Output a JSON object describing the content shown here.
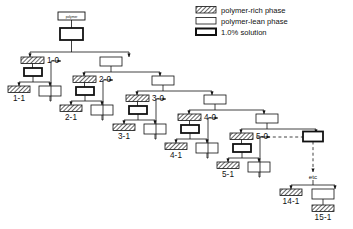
{
  "figure": {
    "background_color": "#ffffff",
    "line_color": "#111111",
    "title": "",
    "type": "cascade-fractionation-tree"
  },
  "legend": {
    "position": "top-right",
    "items": [
      {
        "swatch": "hatched-box",
        "label": "polymer-rich phase"
      },
      {
        "swatch": "plain-box",
        "label": "polymer-lean phase"
      },
      {
        "swatch": "thick-box",
        "label": "1.0% solution"
      }
    ]
  },
  "source": {
    "label": "polymer"
  },
  "stage_labels": [
    "1-0",
    "2-0",
    "3-0",
    "4-0",
    "5-0"
  ],
  "fraction_labels": [
    "1-1",
    "2-1",
    "3-1",
    "4-1",
    "5-1"
  ],
  "continuation": {
    "label": "etc"
  },
  "tail_labels": [
    "14-1",
    "15-1"
  ],
  "box_types": {
    "rich": "polymer-rich phase",
    "lean": "polymer-lean phase",
    "solution": "1.0% solution"
  }
}
